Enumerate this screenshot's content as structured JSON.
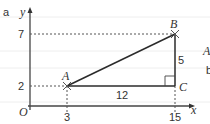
{
  "figure": {
    "part_label": "a",
    "axes": {
      "x_label": "x",
      "y_label": "y",
      "origin_label": "O",
      "x_ticks": [
        "3",
        "15"
      ],
      "y_ticks": [
        "2",
        "7"
      ]
    },
    "points": [
      {
        "name": "A",
        "x": 3,
        "y": 2
      },
      {
        "name": "B",
        "x": 15,
        "y": 7
      },
      {
        "name": "C",
        "x": 15,
        "y": 2
      }
    ],
    "side_lengths": {
      "AC": "12",
      "BC": "5"
    },
    "right_angle_at": "C",
    "edge_fragments": [
      "A",
      "b"
    ]
  },
  "colors": {
    "line": "#2b2b2b",
    "dashed": "#555555",
    "ruled": "#eeeeee",
    "text": "#333333"
  }
}
